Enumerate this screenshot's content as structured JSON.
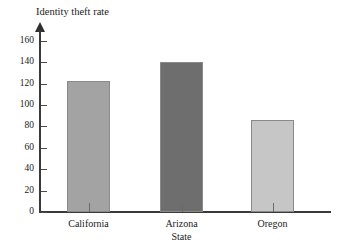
{
  "chart_data": {
    "type": "bar",
    "title": "Identity theft rate",
    "xlabel": "State",
    "ylabel": "Identity theft rate",
    "categories": [
      "California",
      "Arizona",
      "Oregon"
    ],
    "values": [
      122,
      140,
      86
    ],
    "ylim": [
      0,
      170
    ],
    "ytick_labels": [
      "0",
      "20",
      "40",
      "60",
      "80",
      "100",
      "120",
      "140",
      "160"
    ],
    "ytick_values": [
      0,
      20,
      40,
      60,
      80,
      100,
      120,
      140,
      160
    ],
    "grid": false,
    "legend": null,
    "series": [
      {
        "name": "Identity theft rate",
        "values": [
          122,
          140,
          86
        ]
      }
    ],
    "bar_colors": [
      "#a3a3a3",
      "#6e6e6e",
      "#c6c6c6"
    ],
    "axis_color": "#3a3a3a"
  },
  "axis": {
    "y_arrow": "up-arrow-icon"
  }
}
